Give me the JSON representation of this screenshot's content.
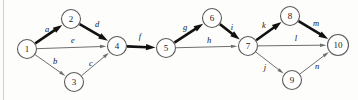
{
  "diagram": {
    "type": "directed-graph",
    "width": 358,
    "height": 100,
    "background_color": "#fdfdfc",
    "critical_color": "#111111",
    "normal_color": "#6e6e6e",
    "node_stroke_color": "#5a5a5a",
    "node_fill_color": "#ffffff",
    "nodes": [
      {
        "id": "1",
        "label": "1",
        "x": 27,
        "y": 49,
        "r": 9.5
      },
      {
        "id": "2",
        "label": "2",
        "x": 71,
        "y": 19,
        "r": 9.5
      },
      {
        "id": "3",
        "label": "3",
        "x": 74,
        "y": 82,
        "r": 9.5
      },
      {
        "id": "4",
        "label": "4",
        "x": 117,
        "y": 46,
        "r": 9.5
      },
      {
        "id": "5",
        "label": "5",
        "x": 166,
        "y": 48,
        "r": 9.5
      },
      {
        "id": "6",
        "label": "6",
        "x": 212,
        "y": 18,
        "r": 9.5
      },
      {
        "id": "7",
        "label": "7",
        "x": 248,
        "y": 46,
        "r": 9.5
      },
      {
        "id": "8",
        "label": "8",
        "x": 290,
        "y": 16,
        "r": 9.5
      },
      {
        "id": "9",
        "label": "9",
        "x": 292,
        "y": 80,
        "r": 9.5
      },
      {
        "id": "10",
        "label": "10",
        "x": 338,
        "y": 45,
        "r": 10.5
      }
    ],
    "edges": [
      {
        "id": "a",
        "label": "a",
        "from": "1",
        "to": "2",
        "critical": true,
        "label_x": 47,
        "label_y": 29
      },
      {
        "id": "b",
        "label": "b",
        "from": "1",
        "to": "3",
        "critical": false,
        "label_x": 55,
        "label_y": 61
      },
      {
        "id": "c",
        "label": "c",
        "from": "3",
        "to": "4",
        "critical": false,
        "label_x": 91,
        "label_y": 63
      },
      {
        "id": "d",
        "label": "d",
        "from": "2",
        "to": "4",
        "critical": true,
        "label_x": 97,
        "label_y": 24
      },
      {
        "id": "e",
        "label": "e",
        "from": "1",
        "to": "4",
        "critical": false,
        "label_x": 73,
        "label_y": 40
      },
      {
        "id": "f",
        "label": "f",
        "from": "4",
        "to": "5",
        "critical": true,
        "label_x": 140,
        "label_y": 36
      },
      {
        "id": "g",
        "label": "g",
        "from": "5",
        "to": "6",
        "critical": true,
        "label_x": 185,
        "label_y": 27
      },
      {
        "id": "h",
        "label": "h",
        "from": "5",
        "to": "7",
        "critical": false,
        "label_x": 209,
        "label_y": 40
      },
      {
        "id": "i",
        "label": "i",
        "from": "6",
        "to": "7",
        "critical": true,
        "label_x": 232,
        "label_y": 27
      },
      {
        "id": "j",
        "label": "j",
        "from": "7",
        "to": "9",
        "critical": false,
        "label_x": 265,
        "label_y": 67
      },
      {
        "id": "k",
        "label": "k",
        "from": "7",
        "to": "8",
        "critical": true,
        "label_x": 264,
        "label_y": 25
      },
      {
        "id": "l",
        "label": "l",
        "from": "7",
        "to": "10",
        "critical": false,
        "label_x": 296,
        "label_y": 38
      },
      {
        "id": "m",
        "label": "m",
        "from": "8",
        "to": "10",
        "critical": true,
        "label_x": 316,
        "label_y": 23
      },
      {
        "id": "n",
        "label": "n",
        "from": "9",
        "to": "10",
        "critical": false,
        "label_x": 317,
        "label_y": 66
      }
    ]
  }
}
